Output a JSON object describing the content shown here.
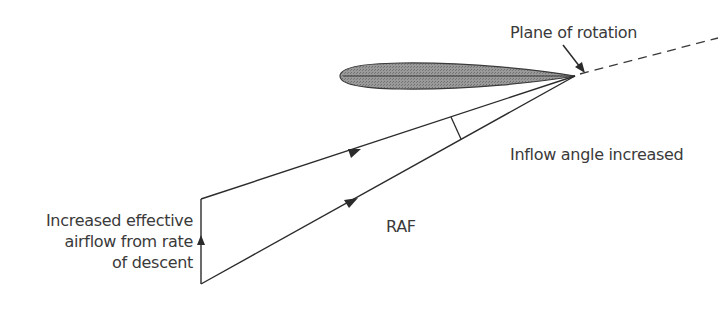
{
  "diagram": {
    "title": "",
    "labels": {
      "plane_of_rotation": "Plane of rotation",
      "inflow_angle": "Inflow angle increased",
      "raf": "RAF",
      "descent_line1": "Increased effective",
      "descent_line2": "airflow from rate",
      "descent_line3": "of descent"
    },
    "colors": {
      "line": "#2b2b2b",
      "airfoil_fill": "#8a8a8a",
      "text": "#3a3a3a"
    },
    "elements": [
      {
        "type": "airfoil",
        "leading_edge": [
          340,
          76
        ],
        "trailing_edge": [
          575,
          76
        ]
      },
      {
        "type": "vector",
        "name": "rotational-airflow",
        "from": [
          201,
          199
        ],
        "to": [
          575,
          76
        ],
        "arrow_at": [
          355,
          151
        ]
      },
      {
        "type": "vector",
        "name": "raf",
        "from": [
          201,
          284
        ],
        "to": [
          575,
          76
        ],
        "arrow_at": [
          350,
          202
        ]
      },
      {
        "type": "vector",
        "name": "descent-airflow",
        "from": [
          201,
          284
        ],
        "to": [
          201,
          199
        ],
        "arrow_at": [
          201,
          241
        ]
      },
      {
        "type": "dashed-line",
        "name": "plane-of-rotation",
        "from": [
          580,
          74
        ],
        "to": [
          718,
          38
        ]
      },
      {
        "type": "pointer",
        "from": [
          562,
          44
        ],
        "to": [
          584,
          72
        ]
      },
      {
        "type": "angle-arc",
        "name": "inflow-angle",
        "center": [
          575,
          76
        ]
      }
    ]
  }
}
